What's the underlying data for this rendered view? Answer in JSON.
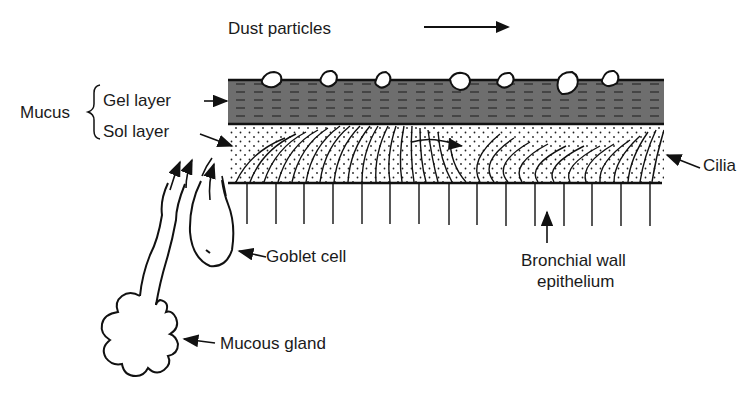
{
  "diagram": {
    "title_label": "Dust particles",
    "labels": {
      "mucus": "Mucus",
      "gel_layer": "Gel layer",
      "sol_layer": "Sol layer",
      "cilia": "Cilia",
      "goblet_cell": "Goblet cell",
      "bronchial_wall_line1": "Bronchial wall",
      "bronchial_wall_line2": "epithelium",
      "mucous_gland": "Mucous gland"
    },
    "colors": {
      "gel_fill": "#6e6e6e",
      "ink": "#111111",
      "background": "#ffffff"
    },
    "structure": {
      "layers": [
        "Gel layer",
        "Sol layer",
        "Cilia",
        "Bronchial wall epithelium"
      ],
      "dust_particle_count": 10,
      "epithelium_cell_lines": 15,
      "flow_direction": "right"
    }
  }
}
